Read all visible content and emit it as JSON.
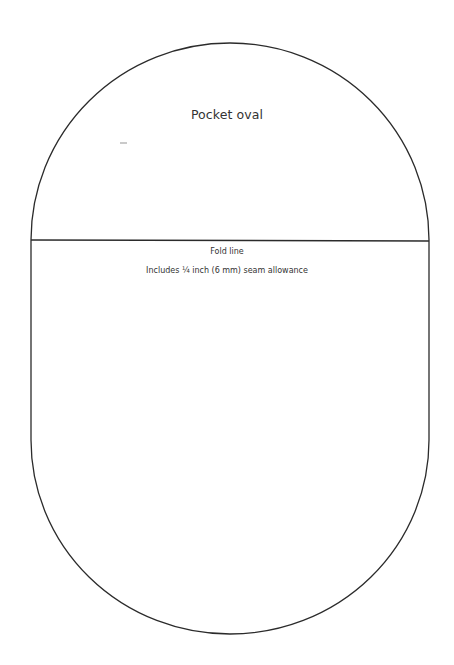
{
  "pattern": {
    "title": "Pocket oval",
    "fold_label": "Fold line",
    "seam_note": "Includes ¼ inch (6 mm) seam allowance",
    "line_color": "#2b2b2b",
    "text_color": "#333333"
  }
}
